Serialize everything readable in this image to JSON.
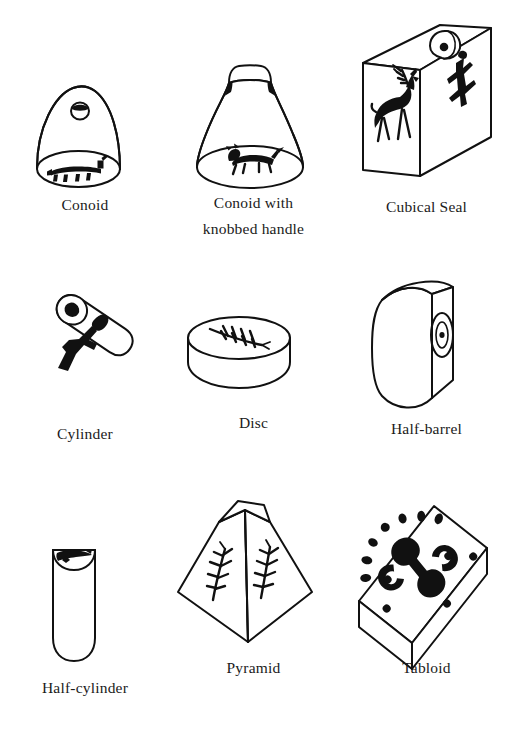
{
  "plate": {
    "title": "Seal shapes typology plate",
    "background_color": "#ffffff",
    "ink_color": "#111111",
    "columns": 3,
    "rows": 3
  },
  "items": [
    {
      "id": "conoid",
      "label": "Conoid",
      "row": 1,
      "column": 1,
      "shape": "dome / bell with pierced hole near apex",
      "motif": "quadruped animal on the oval base",
      "caption_lines": 1
    },
    {
      "id": "conoid-knobbed-handle",
      "label": "Conoid with\nknobbed handle",
      "row": 1,
      "column": 2,
      "shape": "flaring conoid topped by a knobbed handle",
      "motif": "quadruped animal on the oval base",
      "caption_lines": 2
    },
    {
      "id": "cubical-seal",
      "label": "Cubical Seal",
      "row": 1,
      "column": 3,
      "shape": "cube in three-quarter view with loop handle on top",
      "motif": "antlered stag on front face, anthropomorphic figure on side face",
      "caption_lines": 1
    },
    {
      "id": "cylinder",
      "label": "Cylinder",
      "row": 2,
      "column": 1,
      "shape": "tilted cylinder with pierced circular end face",
      "motif": "abstract figure along the barrel",
      "caption_lines": 1
    },
    {
      "id": "disc",
      "label": "Disc",
      "row": 2,
      "column": 2,
      "shape": "short flat disc seen obliquely",
      "motif": "branching plant / herringbone on the top face",
      "caption_lines": 1
    },
    {
      "id": "half-barrel",
      "label": "Half-barrel",
      "row": 2,
      "column": 3,
      "shape": "half-barrel with rounded back and flat engraved front",
      "motif": "concentric oval with central dot",
      "caption_lines": 1
    },
    {
      "id": "half-cylinder",
      "label": "Half-cylinder",
      "row": 3,
      "column": 1,
      "shape": "tall half-cylinder with rounded foot",
      "motif": "dark animal figure on the half-elliptical top",
      "caption_lines": 1
    },
    {
      "id": "pyramid",
      "label": "Pyramid",
      "row": 3,
      "column": 2,
      "shape": "truncated pyramid viewed from a corner",
      "motif": "branching plant on each of the two visible faces",
      "caption_lines": 1
    },
    {
      "id": "tabloid",
      "label": "Tabloid",
      "row": 3,
      "column": 3,
      "shape": "rectangular bar seal in oblique view",
      "motif": "double-spiral scroll with surrounding dots and rays",
      "caption_lines": 1
    }
  ]
}
